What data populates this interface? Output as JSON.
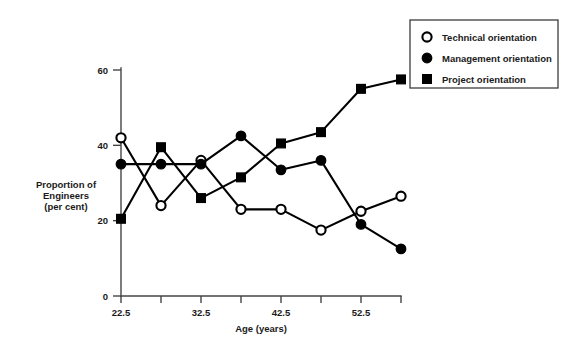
{
  "chart_data": {
    "type": "line",
    "title": "",
    "xlabel": "Age (years)",
    "ylabel": "Proportion of Engineers (per cent)",
    "ylabel_lines": [
      "Proportion of",
      "Engineers",
      "(per cent)"
    ],
    "x": [
      22.5,
      27.5,
      32.5,
      37.5,
      42.5,
      47.5,
      52.5,
      57.5
    ],
    "xtick_labels": [
      "22.5",
      "",
      "32.5",
      "",
      "42.5",
      "",
      "52.5",
      ""
    ],
    "xtick_labels_all": [
      "22.5",
      "27.5",
      "32.5",
      "37.5",
      "42.5",
      "47.5",
      "52.5",
      "57.5"
    ],
    "ytick_values": [
      0,
      20,
      40,
      60
    ],
    "ytick_labels": [
      "0",
      "20",
      "40",
      "60"
    ],
    "xlim": [
      22.5,
      57.5
    ],
    "ylim": [
      0,
      60
    ],
    "grid": false,
    "legend_position": "top-right",
    "series": [
      {
        "name": "Technical orientation",
        "marker": "open-circle",
        "color": "#000000",
        "values": [
          42,
          24,
          36,
          23,
          23,
          17.5,
          22.5,
          26.5
        ]
      },
      {
        "name": "Management orientation",
        "marker": "filled-circle",
        "color": "#000000",
        "values": [
          35,
          35,
          35,
          42.5,
          33.5,
          36,
          19,
          12.5
        ]
      },
      {
        "name": "Project orientation",
        "marker": "filled-square",
        "color": "#000000",
        "values": [
          20.5,
          39.5,
          26,
          31.5,
          40.5,
          43.5,
          55,
          57.5
        ]
      }
    ]
  },
  "legend": {
    "items": [
      {
        "label": "Technical orientation",
        "marker": "open-circle"
      },
      {
        "label": "Management orientation",
        "marker": "filled-circle"
      },
      {
        "label": "Project orientation",
        "marker": "filled-square"
      }
    ]
  }
}
